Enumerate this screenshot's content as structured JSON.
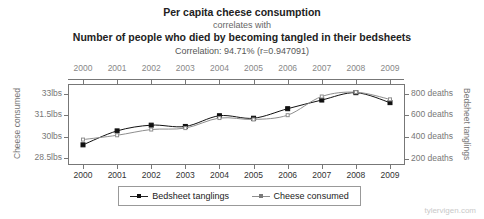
{
  "title": {
    "line1": "Per capita cheese consumption",
    "line2": "correlates with",
    "line3": "Number of people who died by becoming tangled in their bedsheets",
    "correlation": "Correlation: 94.71% (r=0.947091)"
  },
  "watermark": "tylervigen.com",
  "legend": {
    "items": [
      {
        "label": "Bedsheet tanglings",
        "color": "#111111"
      },
      {
        "label": "Cheese consumed",
        "color": "#8e8e8e"
      }
    ]
  },
  "chart_data": {
    "type": "line",
    "title": "Per capita cheese consumption correlates with Number of people who died by becoming tangled in their bedsheets",
    "xlabel": "",
    "x": [
      2000,
      2001,
      2002,
      2003,
      2004,
      2005,
      2006,
      2007,
      2008,
      2009
    ],
    "x_tick_labels": [
      "2000",
      "2001",
      "2002",
      "2003",
      "2004",
      "2005",
      "2006",
      "2007",
      "2008",
      "2009"
    ],
    "grid": false,
    "legend_position": "bottom",
    "axes": [
      {
        "id": "left",
        "label": "Cheese consumed",
        "tick_labels": [
          "33lbs",
          "31.5lbs",
          "30lbs",
          "28.5lbs"
        ],
        "tick_values": [
          33,
          31.5,
          30,
          28.5
        ],
        "ylim": [
          28.1,
          33.6
        ]
      },
      {
        "id": "right",
        "label": "Bedsheet tanglings",
        "tick_labels": [
          "800 deaths",
          "600 deaths",
          "400 deaths",
          "200 deaths"
        ],
        "tick_values": [
          800,
          600,
          400,
          200
        ],
        "ylim": [
          150,
          880
        ]
      }
    ],
    "series": [
      {
        "name": "Bedsheet tanglings",
        "axis": "right",
        "color": "#111111",
        "marker": "filled-square",
        "values": [
          327,
          456,
          509,
          497,
          596,
          573,
          661,
          741,
          809,
          717
        ],
        "units": "deaths"
      },
      {
        "name": "Cheese consumed",
        "axis": "left",
        "color": "#8e8e8e",
        "marker": "open-square",
        "values": [
          29.8,
          30.1,
          30.5,
          30.6,
          31.3,
          31.2,
          31.5,
          32.8,
          33.1,
          32.6
        ],
        "units": "lbs"
      }
    ]
  }
}
